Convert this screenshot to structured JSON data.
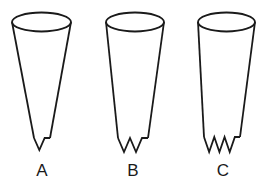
{
  "figure": {
    "width": 264,
    "height": 183,
    "background_color": "#ffffff",
    "stroke_color": "#1a1a1a",
    "label_color": "#1a1a1a",
    "caption": ""
  },
  "cones": [
    {
      "id": "cone-a",
      "label": "A",
      "label_x": 42,
      "label_y": 176,
      "rim": {
        "cx": 41.5,
        "cy": 22,
        "rx": 29.5,
        "ry": 9.5
      },
      "left_top_x": 12,
      "right_top_x": 71,
      "top_y": 22,
      "bottom_y": 146,
      "left_bottom_x": 34,
      "right_bottom_x": 50,
      "jag_peaks": 1,
      "jag_top_y": 138,
      "jag_bottom_y": 150,
      "stroke_width": 1.8,
      "taper": "narrow",
      "description": "narrowest cone, single notch"
    },
    {
      "id": "cone-b",
      "label": "B",
      "label_x": 133,
      "label_y": 176,
      "rim": {
        "cx": 135,
        "cy": 22,
        "rx": 29,
        "ry": 9.5
      },
      "left_top_x": 106,
      "right_top_x": 164,
      "top_y": 22,
      "bottom_y": 146,
      "left_bottom_x": 118,
      "right_bottom_x": 148,
      "jag_peaks": 2,
      "jag_top_y": 138,
      "jag_bottom_y": 152,
      "stroke_width": 1.8,
      "taper": "medium",
      "description": "medium taper cone, two notches"
    },
    {
      "id": "cone-c",
      "label": "C",
      "label_x": 223,
      "label_y": 176,
      "rim": {
        "cx": 226.5,
        "cy": 22,
        "rx": 28.5,
        "ry": 9.5
      },
      "left_top_x": 198,
      "right_top_x": 255,
      "top_y": 22,
      "bottom_y": 146,
      "left_bottom_x": 204,
      "right_bottom_x": 240,
      "jag_peaks": 3,
      "jag_top_y": 137,
      "jag_bottom_y": 152,
      "stroke_width": 1.8,
      "taper": "wide",
      "description": "widest, near-cylindrical cone, three notches"
    }
  ]
}
